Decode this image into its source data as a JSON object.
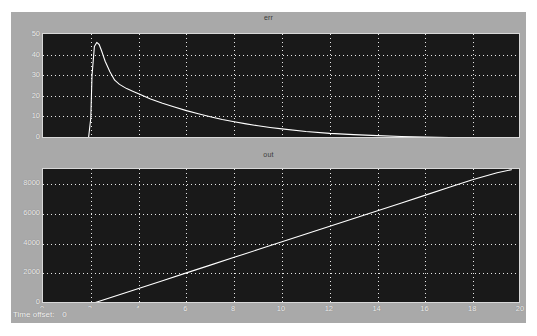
{
  "window": {
    "name": "scope-window",
    "background_color": "#a9a9a9",
    "plot_background_color": "#191919",
    "trace_color": "#ffffff",
    "grid_color": "#e8e8e8"
  },
  "status_bar": {
    "label": "Time offset:",
    "value": "0"
  },
  "chart_data": [
    {
      "type": "line",
      "title": "err",
      "xlabel": "",
      "ylabel": "",
      "xlim": [
        0,
        20
      ],
      "ylim": [
        0,
        50
      ],
      "xticks": [
        0,
        2,
        4,
        6,
        8,
        10,
        12,
        14,
        16,
        18,
        20
      ],
      "yticks": [
        0,
        10,
        20,
        30,
        40,
        50
      ],
      "grid": true,
      "legend": "none",
      "series": [
        {
          "name": "err",
          "x": [
            0,
            0.5,
            1.0,
            1.5,
            1.9,
            2.0,
            2.05,
            2.15,
            2.25,
            2.35,
            2.45,
            2.6,
            2.8,
            3.0,
            3.2,
            3.5,
            3.8,
            4.0,
            4.5,
            5.0,
            5.5,
            6.0,
            6.5,
            7.0,
            7.5,
            8.0,
            8.5,
            9.0,
            9.5,
            10.0,
            11.0,
            12.0,
            13.0,
            14.0,
            15.0,
            16.0,
            17.0,
            18.0,
            19.0,
            20.0
          ],
          "values": [
            0,
            0,
            0,
            0,
            0,
            10,
            30,
            44,
            46,
            45,
            42,
            37,
            32,
            28,
            26,
            24,
            22.5,
            21.5,
            19,
            17,
            15.2,
            13.5,
            12,
            10.6,
            9.3,
            8.2,
            7.2,
            6.3,
            5.5,
            4.8,
            3.6,
            2.7,
            2.1,
            1.6,
            1.2,
            0.9,
            0.7,
            0.5,
            0.4,
            0.3
          ]
        }
      ]
    },
    {
      "type": "line",
      "title": "out",
      "xlabel": "",
      "ylabel": "",
      "xlim": [
        0,
        20
      ],
      "ylim": [
        0,
        9200
      ],
      "xticks": [
        0,
        2,
        4,
        6,
        8,
        10,
        12,
        14,
        16,
        18,
        20
      ],
      "yticks": [
        0,
        2000,
        4000,
        6000,
        8000
      ],
      "grid": true,
      "legend": "none",
      "series": [
        {
          "name": "out",
          "x": [
            0,
            1.0,
            2.0,
            3.0,
            4.0,
            5.0,
            6.0,
            7.0,
            8.0,
            9.0,
            10.0,
            11.0,
            12.0,
            13.0,
            14.0,
            15.0,
            16.0,
            17.0,
            18.0,
            19.0,
            19.6
          ],
          "values": [
            0,
            0,
            0,
            530,
            1060,
            1590,
            2120,
            2650,
            3180,
            3710,
            4240,
            4770,
            5300,
            5830,
            6360,
            6890,
            7420,
            7950,
            8480,
            8950,
            9150
          ]
        }
      ]
    }
  ]
}
